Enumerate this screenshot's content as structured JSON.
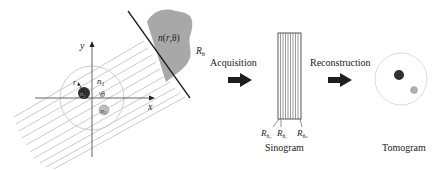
{
  "diagram": {
    "axes": {
      "x_label": "x",
      "y_label": "y"
    },
    "object": {
      "radius_label": "r",
      "region_labels": {
        "background": "n1",
        "inclusion_dark": "n2",
        "inclusion_light": "n3"
      },
      "angle_label": "θ",
      "field_label": "n(r,θ)",
      "projection_label": "Rθ"
    },
    "steps": [
      {
        "label": "Acquisition"
      },
      {
        "label": "Reconstruction"
      }
    ],
    "sinogram": {
      "caption": "Sinogram",
      "projection_labels": [
        "Rθ0",
        "Rθ1",
        "Rθn"
      ]
    },
    "tomogram": {
      "caption": "Tomogram"
    },
    "colors": {
      "line": "#222222",
      "beam": "#bdbdbd",
      "shadow": "#a8a8a8",
      "dark_inclusion": "#333333",
      "light_inclusion": "#aaaaaa",
      "circle": "#cfcfcf"
    }
  }
}
